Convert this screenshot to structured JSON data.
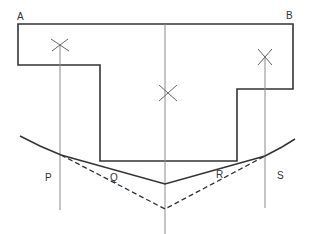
{
  "diagram": {
    "labels": {
      "A": "A",
      "B": "B",
      "P": "P",
      "Q": "Q",
      "R": "R",
      "S": "S"
    },
    "colors": {
      "outline": "#333333",
      "guide": "#8a8a8a",
      "background": "#ffffff"
    },
    "shape": {
      "description": "T-shaped outline with top edge A–B",
      "points": [
        [
          18,
          24
        ],
        [
          293,
          24
        ],
        [
          293,
          89
        ],
        [
          237,
          89
        ],
        [
          237,
          161
        ],
        [
          100,
          161
        ],
        [
          100,
          65
        ],
        [
          18,
          65
        ]
      ]
    },
    "vertical_lines": [
      {
        "x": 59,
        "y1": 45,
        "y2": 210
      },
      {
        "x": 165,
        "y1": 24,
        "y2": 234
      },
      {
        "x": 265,
        "y1": 57,
        "y2": 208
      }
    ],
    "cross_marks": [
      {
        "x": 62,
        "y": 45
      },
      {
        "x": 170,
        "y": 93
      },
      {
        "x": 265,
        "y": 57
      }
    ],
    "solid_curve": [
      [
        20,
        136
      ],
      [
        61,
        155
      ],
      [
        165,
        184
      ],
      [
        265,
        156
      ],
      [
        295,
        139
      ]
    ],
    "dashed_curve": [
      [
        61,
        155
      ],
      [
        165,
        209
      ],
      [
        265,
        156
      ]
    ]
  }
}
